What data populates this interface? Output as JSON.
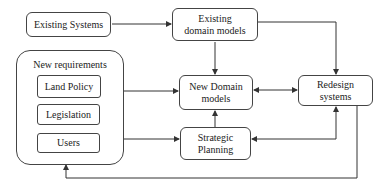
{
  "nodes": {
    "existing_systems": "Existing Systems",
    "existing_domain_models": "Existing domain models",
    "new_requirements": "New requirements",
    "land_policy": "Land Policy",
    "legislation": "Legislation",
    "users": "Users",
    "new_domain_models": "New Domain models",
    "redesign_systems": "Redesign systems",
    "strategic_planning": "Strategic Planning"
  },
  "colors": {
    "line": "#333333",
    "border": "#444444",
    "background": "#ffffff"
  }
}
